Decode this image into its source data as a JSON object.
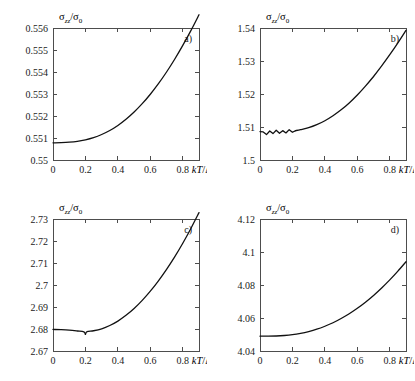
{
  "figure": {
    "background": "#ffffff",
    "curve_color": "#111111",
    "axis_color": "#4d4d4d",
    "panel_count": 4
  },
  "axis_text": {
    "xlabel_prefix": "kT",
    "xlabel_slash": "/",
    "xlabel_denominator": "Δ",
    "ylabel_sigma": "σ",
    "ylabel_sub_numer": "zz",
    "ylabel_slash": "/",
    "ylabel_sub_denom": "0"
  },
  "chart_data": [
    {
      "type": "line",
      "panel": "a)",
      "title": "",
      "xlabel": "kT/Δ",
      "ylabel": "σ_zz/σ_0",
      "xlim": [
        0,
        0.9
      ],
      "ylim": [
        0.55,
        0.556
      ],
      "xticks": [
        0,
        0.2,
        0.4,
        0.6,
        0.8
      ],
      "xticklabels": [
        "0",
        "0.2",
        "0.4",
        "0.6",
        "0.8"
      ],
      "yticks": [
        0.55,
        0.551,
        0.552,
        0.553,
        0.554,
        0.555,
        0.556
      ],
      "yticklabels": [
        "0.55",
        "0.551",
        "0.552",
        "0.553",
        "0.554",
        "0.555",
        "0.556"
      ],
      "grid": false,
      "legend": null,
      "x": [
        0.0,
        0.05,
        0.1,
        0.15,
        0.2,
        0.25,
        0.3,
        0.35,
        0.4,
        0.45,
        0.5,
        0.55,
        0.6,
        0.65,
        0.7,
        0.75,
        0.8,
        0.85,
        0.9
      ],
      "y": [
        0.55078,
        0.55079,
        0.55081,
        0.55085,
        0.55092,
        0.55102,
        0.55116,
        0.55134,
        0.55157,
        0.55185,
        0.55218,
        0.55256,
        0.55299,
        0.55347,
        0.554,
        0.55458,
        0.55521,
        0.55588,
        0.5566
      ]
    },
    {
      "type": "line",
      "panel": "b)",
      "title": "",
      "xlabel": "kT/Δ",
      "ylabel": "σ_zz/σ_0",
      "xlim": [
        0,
        0.9
      ],
      "ylim": [
        1.5,
        1.54
      ],
      "xticks": [
        0,
        0.2,
        0.4,
        0.6,
        0.8
      ],
      "xticklabels": [
        "0",
        "0.2",
        "0.4",
        "0.6",
        "0.8"
      ],
      "yticks": [
        1.5,
        1.51,
        1.52,
        1.53,
        1.54
      ],
      "yticklabels": [
        "1.5",
        "1.51",
        "1.52",
        "1.53",
        "1.54"
      ],
      "grid": false,
      "legend": null,
      "noise_region": [
        0.0,
        0.22
      ],
      "noise_amplitude": 0.0011,
      "x": [
        0.0,
        0.02,
        0.04,
        0.06,
        0.08,
        0.1,
        0.12,
        0.14,
        0.16,
        0.18,
        0.2,
        0.22,
        0.25,
        0.3,
        0.35,
        0.4,
        0.45,
        0.5,
        0.55,
        0.6,
        0.65,
        0.7,
        0.75,
        0.8,
        0.85,
        0.9
      ],
      "y": [
        1.5086,
        1.5085,
        1.5077,
        1.5088,
        1.508,
        1.509,
        1.5081,
        1.5089,
        1.5082,
        1.5092,
        1.5084,
        1.5089,
        1.5092,
        1.5098,
        1.5107,
        1.5119,
        1.5134,
        1.5152,
        1.5173,
        1.5197,
        1.5224,
        1.5253,
        1.5285,
        1.5319,
        1.5355,
        1.5393
      ]
    },
    {
      "type": "line",
      "panel": "c)",
      "title": "",
      "xlabel": "kT/Δ",
      "ylabel": "σ_zz/σ_0",
      "xlim": [
        0,
        0.9
      ],
      "ylim": [
        2.67,
        2.73
      ],
      "xticks": [
        0,
        0.2,
        0.4,
        0.6,
        0.8
      ],
      "xticklabels": [
        "0",
        "0.2",
        "0.4",
        "0.6",
        "0.8"
      ],
      "yticks": [
        2.67,
        2.68,
        2.69,
        2.7,
        2.71,
        2.72,
        2.73
      ],
      "yticklabels": [
        "2.67",
        "2.68",
        "2.69",
        "2.7",
        "2.71",
        "2.72",
        "2.73"
      ],
      "grid": false,
      "legend": null,
      "minimum_at": 0.2,
      "x": [
        0.0,
        0.05,
        0.1,
        0.15,
        0.19,
        0.2,
        0.21,
        0.25,
        0.3,
        0.35,
        0.4,
        0.45,
        0.5,
        0.55,
        0.6,
        0.65,
        0.7,
        0.75,
        0.8,
        0.85,
        0.9
      ],
      "y": [
        2.6798,
        2.6797,
        2.6795,
        2.6791,
        2.6787,
        2.6776,
        2.6788,
        2.6792,
        2.6801,
        2.6816,
        2.6836,
        2.6862,
        2.6893,
        2.693,
        2.6972,
        2.7019,
        2.7071,
        2.7128,
        2.719,
        2.7257,
        2.7329
      ]
    },
    {
      "type": "line",
      "panel": "d)",
      "title": "",
      "xlabel": "kT/Δ",
      "ylabel": "σ_zz/σ_0",
      "xlim": [
        0,
        0.9
      ],
      "ylim": [
        4.04,
        4.12
      ],
      "xticks": [
        0,
        0.2,
        0.4,
        0.6,
        0.8
      ],
      "xticklabels": [
        "0",
        "0.2",
        "0.4",
        "0.6",
        "0.8"
      ],
      "yticks": [
        4.04,
        4.06,
        4.08,
        4.1,
        4.12
      ],
      "yticklabels": [
        "4.04",
        "4.06",
        "4.08",
        "4.1",
        "4.12"
      ],
      "grid": false,
      "legend": null,
      "x": [
        0.0,
        0.05,
        0.1,
        0.15,
        0.2,
        0.25,
        0.3,
        0.35,
        0.4,
        0.45,
        0.5,
        0.55,
        0.6,
        0.65,
        0.7,
        0.75,
        0.8,
        0.85,
        0.9
      ],
      "y": [
        4.049,
        4.049,
        4.0491,
        4.0494,
        4.0499,
        4.0507,
        4.0518,
        4.0532,
        4.055,
        4.0571,
        4.0597,
        4.0626,
        4.0659,
        4.0696,
        4.0737,
        4.0782,
        4.0831,
        4.0884,
        4.0941
      ]
    }
  ]
}
